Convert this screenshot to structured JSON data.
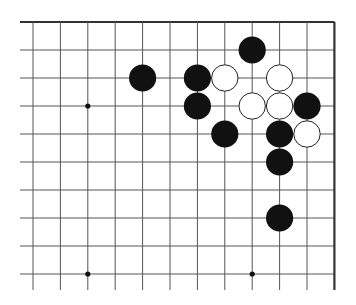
{
  "board": {
    "type": "go-diagram",
    "columns": 12,
    "rows": 10,
    "origin_x": 33,
    "origin_y": 22,
    "spacing_x": 27.4,
    "spacing_y": 28,
    "left_extent": 20,
    "bottom_extent": 290,
    "edges": {
      "top": true,
      "right": true,
      "left": false,
      "bottom": false
    },
    "colors": {
      "line": "#555555",
      "edge": "#333333",
      "black": "#111111",
      "white": "#ffffff",
      "white_outline": "#222222"
    },
    "star_points": [
      {
        "col": 2,
        "row": 3
      },
      {
        "col": 2,
        "row": 9
      },
      {
        "col": 8,
        "row": 9
      }
    ],
    "stones": [
      {
        "color": "black",
        "col": 8,
        "row": 1
      },
      {
        "color": "black",
        "col": 4,
        "row": 2
      },
      {
        "color": "black",
        "col": 6,
        "row": 2
      },
      {
        "color": "white",
        "col": 7,
        "row": 2
      },
      {
        "color": "white",
        "col": 9,
        "row": 2
      },
      {
        "color": "black",
        "col": 6,
        "row": 3
      },
      {
        "color": "white",
        "col": 8,
        "row": 3
      },
      {
        "color": "white",
        "col": 9,
        "row": 3
      },
      {
        "color": "black",
        "col": 10,
        "row": 3
      },
      {
        "color": "black",
        "col": 7,
        "row": 4
      },
      {
        "color": "black",
        "col": 9,
        "row": 4
      },
      {
        "color": "white",
        "col": 10,
        "row": 4
      },
      {
        "color": "black",
        "col": 9,
        "row": 5
      },
      {
        "color": "black",
        "col": 9,
        "row": 7
      }
    ]
  }
}
